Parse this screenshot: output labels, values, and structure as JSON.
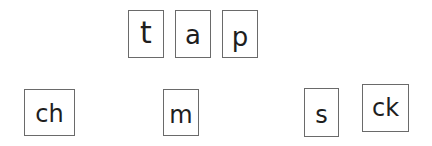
{
  "word_cards": {
    "row_top": [
      {
        "id": "t",
        "label": "t"
      },
      {
        "id": "a",
        "label": "a"
      },
      {
        "id": "p",
        "label": "p"
      }
    ],
    "row_bottom": [
      {
        "id": "ch",
        "label": "ch"
      },
      {
        "id": "m",
        "label": "m"
      },
      {
        "id": "s",
        "label": "s"
      },
      {
        "id": "ck",
        "label": "ck"
      }
    ]
  },
  "colors": {
    "border": "#6a6a6a",
    "text": "#1e1e1e",
    "background": "#ffffff"
  }
}
